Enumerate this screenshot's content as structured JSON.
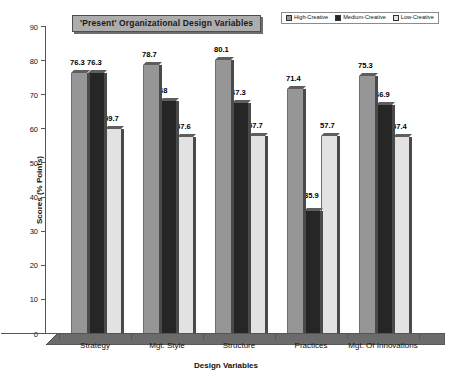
{
  "chart_data": {
    "type": "bar",
    "title": "'Present' Organizational Design Variables",
    "xlabel": "Design Variables",
    "ylabel": "Scores (% Points)",
    "ylim": [
      0,
      90
    ],
    "ytick_step": 10,
    "yticks": [
      90,
      80,
      70,
      60,
      50,
      40,
      30,
      20,
      10,
      0
    ],
    "grid": false,
    "legend_position": "top-right",
    "three_d": true,
    "categories": [
      "Strategy",
      "Mgt. Style",
      "Structure",
      "Practices",
      "Mgt. Of Innovations"
    ],
    "series": [
      {
        "name": "High-Creative",
        "color": "#969696",
        "values": [
          76.3,
          78.7,
          80.1,
          71.4,
          75.3
        ],
        "labels": [
          "76.3",
          "78.7",
          "80.1",
          "71.4",
          "75.3"
        ]
      },
      {
        "name": "Medium-Creative",
        "color": "#262626",
        "values": [
          76.3,
          68,
          67.3,
          35.9,
          66.9
        ],
        "labels": [
          "76.3",
          "68",
          "67.3",
          "35.9",
          "66.9"
        ]
      },
      {
        "name": "Low-Creative",
        "color": "#e2e2e2",
        "values": [
          59.7,
          57.6,
          57.7,
          57.7,
          57.4
        ],
        "labels": [
          "59.7",
          "57.6",
          "57.7",
          "57.7",
          "57.4"
        ]
      }
    ]
  },
  "colors": {
    "series_high": "#969696",
    "series_medium": "#262626",
    "series_low": "#e2e2e2",
    "title_background": "#adadad",
    "axis": "#555555",
    "floor": "#6b6b6b",
    "bar_side": "#4a4a4a"
  }
}
